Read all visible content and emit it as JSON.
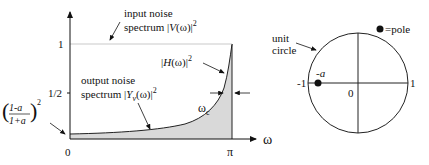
{
  "left_plot": {
    "x_axis_label": "ω",
    "y_ticks": {
      "one": "1",
      "half": "1/2"
    },
    "x_ticks": {
      "zero": "0",
      "pi": "π"
    },
    "input_noise": {
      "line1": "input  noise",
      "line2_prefix": "spectrum  |",
      "line2_var": "V",
      "line2_suffix": "(ω)|",
      "sup": "2"
    },
    "output_noise": {
      "line1": "output  noise",
      "line2_prefix": "spectrum  |",
      "line2_var": "Y",
      "line2_sub": "v",
      "line2_suffix": "(ω)|",
      "sup": "2"
    },
    "filter_response": {
      "prefix": "|",
      "var": "H",
      "suffix": "(ω)|",
      "sup": "2"
    },
    "cutoff_label": {
      "main": "ω",
      "sub": "c"
    },
    "min_value_label": {
      "num": "1-a",
      "den": "1+a",
      "sup": "2"
    },
    "fill_color": "#d9d9d9"
  },
  "right_plot": {
    "unit_circle_label": {
      "line1": "unit",
      "line2": "circle"
    },
    "legend": {
      "symbol": "●",
      "text": "=pole"
    },
    "pole_label": "-a",
    "tick_minus_one": "-1",
    "tick_one": "1",
    "origin": "0"
  }
}
